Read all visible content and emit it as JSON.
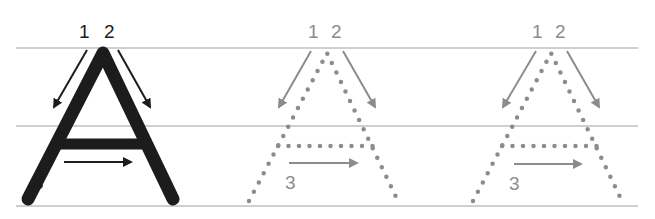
{
  "worksheet": {
    "letter": "A",
    "guide_lines": [
      "top",
      "middle",
      "baseline"
    ],
    "colors": {
      "solid_stroke": "#1c1c1c",
      "trace_dots": "#8c8c8c",
      "guide_line": "#cfcfcf"
    },
    "letters": [
      {
        "style": "solid",
        "stroke_labels": {
          "s1": "1",
          "s2": "2",
          "s3": "3"
        }
      },
      {
        "style": "dotted",
        "stroke_labels": {
          "s1": "1",
          "s2": "2",
          "s3": "3"
        }
      },
      {
        "style": "dotted",
        "stroke_labels": {
          "s1": "1",
          "s2": "2",
          "s3": "3"
        }
      }
    ]
  }
}
